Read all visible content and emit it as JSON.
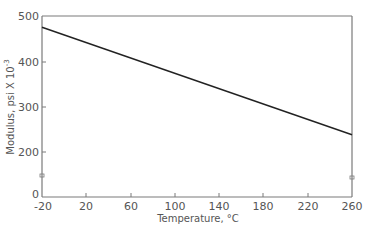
{
  "chart_data": {
    "type": "line",
    "title": "",
    "xlabel": "Temperature, °C",
    "ylabel": "Modulus, psi X 10",
    "ylabel_exponent": "-3",
    "xlim": [
      -20,
      260
    ],
    "ylim": [
      0,
      500
    ],
    "x_ticks": [
      "-20",
      "20",
      "60",
      "100",
      "140",
      "180",
      "220",
      "260"
    ],
    "y_ticks": [
      "0",
      "200",
      "300",
      "400",
      "500"
    ],
    "grid": false,
    "legend": null,
    "series": [
      {
        "name": "Modulus",
        "x": [
          -20,
          260
        ],
        "values": [
          469,
          172
        ],
        "color": "#222222"
      }
    ],
    "annotations": [
      {
        "type": "axis-break-marker",
        "axis": "left",
        "approx_y": 145
      },
      {
        "type": "axis-break-marker",
        "axis": "right",
        "approx_y": 140
      }
    ]
  },
  "labels": {
    "xlabel": "Temperature, °C",
    "ylabel_main": "Modulus, psi X 10",
    "ylabel_exp": "-3"
  },
  "ticks": {
    "x": [
      "-20",
      "20",
      "60",
      "100",
      "140",
      "180",
      "220",
      "260"
    ],
    "y": [
      "0",
      "200",
      "300",
      "400",
      "500"
    ]
  },
  "colors": {
    "axis": "#777777",
    "line": "#222222",
    "text": "#555555"
  }
}
